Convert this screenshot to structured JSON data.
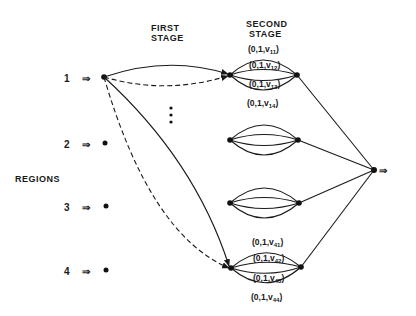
{
  "headers": {
    "first_stage_line1": "FIRST",
    "first_stage_line2": "STAGE",
    "second_stage_line1": "SECOND",
    "second_stage_line2": "STAGE",
    "regions": "REGIONS"
  },
  "regions": [
    {
      "label": "1"
    },
    {
      "label": "2"
    },
    {
      "label": "3"
    },
    {
      "label": "4"
    }
  ],
  "input_arrow_glyph": "⇒",
  "output_arrow_glyph": "⇒",
  "ellipsis": "⋮",
  "stage2_clusters": [
    {
      "id": 1,
      "edge_labels": [
        {
          "prefix": "(0,1,v",
          "sub": "11",
          "suffix": ")"
        },
        {
          "prefix": "(0,1,v",
          "sub": "12",
          "suffix": ")"
        },
        {
          "prefix": "(0,1,v",
          "sub": "13",
          "suffix": ")"
        },
        {
          "prefix": "(0,1,v",
          "sub": "14",
          "suffix": ")"
        }
      ]
    },
    {
      "id": 2,
      "edge_labels": []
    },
    {
      "id": 3,
      "edge_labels": []
    },
    {
      "id": 4,
      "edge_labels": [
        {
          "prefix": "(0,1,v",
          "sub": "41",
          "suffix": ")"
        },
        {
          "prefix": "(0,1,v",
          "sub": "42",
          "suffix": ")"
        },
        {
          "prefix": "(0,1,v",
          "sub": "43",
          "suffix": ")"
        },
        {
          "prefix": "(0,1,v",
          "sub": "44",
          "suffix": ")"
        }
      ]
    }
  ],
  "first_stage_edges": [
    {
      "from": "region-1",
      "to": "cluster-1",
      "style": "solid"
    },
    {
      "from": "region-1",
      "to": "cluster-1",
      "style": "dashed"
    },
    {
      "from": "region-1",
      "to": "cluster-4",
      "style": "solid"
    },
    {
      "from": "region-1",
      "to": "cluster-4",
      "style": "dashed"
    }
  ],
  "colors": {
    "ink": "#1a1a1a",
    "background": "#ffffff"
  }
}
